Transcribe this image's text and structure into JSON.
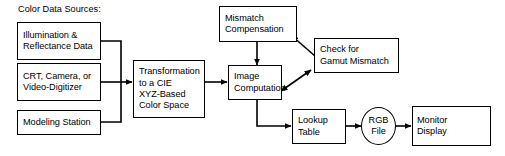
{
  "diagram": {
    "title": "Color Data Sources:",
    "background_color": "#ffffff",
    "stroke_color": "#000000",
    "nodes": {
      "illumination": {
        "lines": [
          "Illumination &",
          "Reflectance Data"
        ]
      },
      "crt_camera": {
        "lines": [
          "CRT, Camera, or",
          "Video-Digitizer"
        ]
      },
      "modeling_station": {
        "lines": [
          "Modeling Station"
        ]
      },
      "transformation": {
        "lines": [
          "Transformation",
          "to a CIE",
          "XYZ-Based",
          "Color Space"
        ]
      },
      "mismatch_compensation": {
        "lines": [
          "Mismatch",
          "Compensation"
        ]
      },
      "check_gamut": {
        "lines": [
          "Check for",
          "Gamut Mismatch"
        ]
      },
      "image_computation": {
        "lines": [
          "Image",
          "Computation"
        ]
      },
      "lookup_table": {
        "lines": [
          "Lookup",
          "Table"
        ]
      },
      "rgb_file": {
        "lines": [
          "RGB",
          "File"
        ]
      },
      "monitor_display": {
        "lines": [
          "Monitor",
          "Display"
        ]
      }
    }
  }
}
